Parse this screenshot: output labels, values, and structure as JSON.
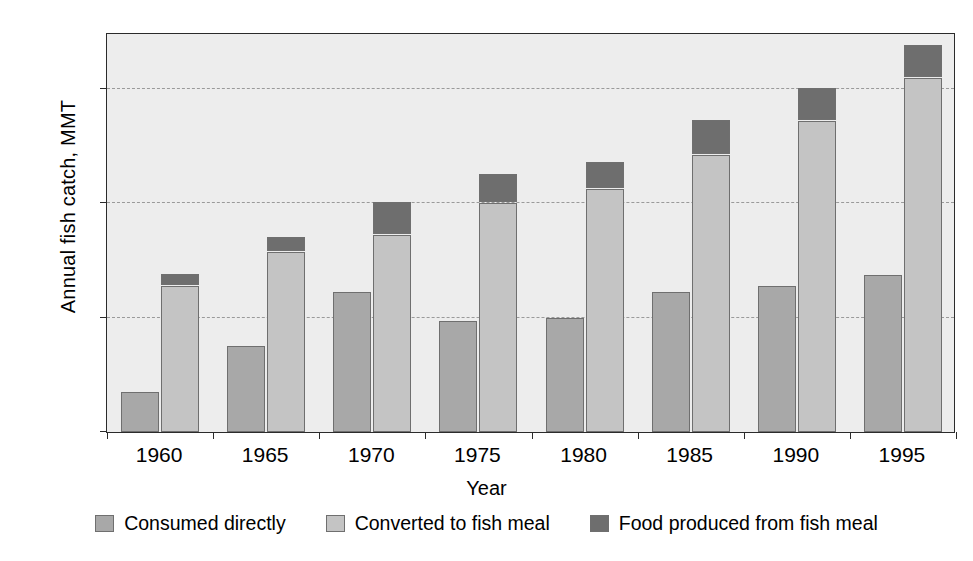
{
  "chart_data": {
    "type": "bar",
    "subtype": "grouped-stacked",
    "title": "",
    "xlabel": "Year",
    "ylabel": "Annual fish catch, MMT",
    "categories": [
      "1960",
      "1965",
      "1970",
      "1975",
      "1980",
      "1985",
      "1990",
      "1995"
    ],
    "ylim": [
      0,
      70
    ],
    "yticks": [
      0,
      20,
      40,
      60
    ],
    "ytick_labels": [
      "0",
      "20",
      "40",
      "60"
    ],
    "grid": "horizontal-dashed",
    "legend_position": "bottom",
    "units": "MMT",
    "series": [
      {
        "name": "Consumed directly",
        "color": "#a8a8a8",
        "group": "left-bar",
        "values": [
          7,
          15,
          24.5,
          19.5,
          20,
          24.5,
          25.5,
          27.5
        ]
      },
      {
        "name": "Converted to fish meal",
        "color": "#c4c4c4",
        "group": "right-bar",
        "stack_order": 1,
        "values": [
          25.5,
          31.5,
          34.5,
          40,
          42.5,
          48.5,
          54.5,
          62
        ]
      },
      {
        "name": "Food produced from fish meal",
        "color": "#6e6e6e",
        "group": "right-bar",
        "stack_order": 2,
        "values": [
          2,
          2.5,
          5.5,
          5,
          4.5,
          6,
          5.5,
          5.5
        ],
        "cumulative_tops": [
          27.5,
          34,
          40,
          45,
          47,
          54.5,
          60,
          67.5
        ]
      }
    ]
  },
  "legend": {
    "items": [
      {
        "label": "Consumed directly",
        "color": "#a8a8a8"
      },
      {
        "label": "Converted to fish meal",
        "color": "#c4c4c4"
      },
      {
        "label": "Food produced from fish meal",
        "color": "#6e6e6e"
      }
    ]
  },
  "colors": {
    "plot_background": "#ededed",
    "frame": "#2b2b2b",
    "gridline": "#9a9a9a",
    "bar_outline": "#6f6f6f",
    "page_background": "#ffffff"
  }
}
